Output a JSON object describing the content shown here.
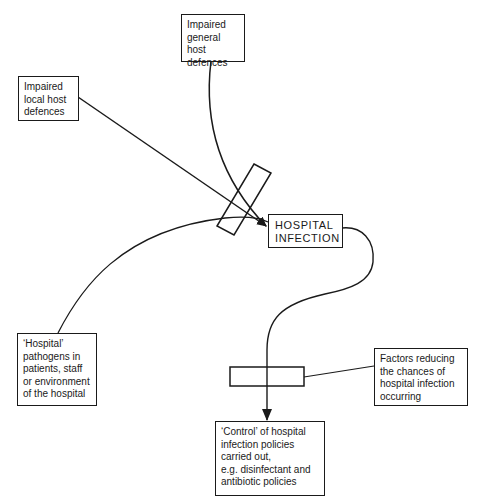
{
  "diagram": {
    "nodes": {
      "general_host": {
        "label": "Impaired\ngeneral host\ndefences"
      },
      "local_host": {
        "label": "Impaired\nlocal host\ndefences"
      },
      "hospital_infection": {
        "label": "HOSPITAL\nINFECTION"
      },
      "pathogens": {
        "label": "‘Hospital’\npathogens in\npatients, staff\nor environment\nof the hospital"
      },
      "factors": {
        "label": "Factors reducing\nthe chances of\nhospital infection\noccurring"
      },
      "control": {
        "label": "‘Control’ of hospital\ninfection policies\ncarried out,\ne.g. disinfectant and\nantibiotic policies"
      }
    },
    "edges": [
      {
        "from": "general_host",
        "to": "hospital_infection",
        "arrow": true
      },
      {
        "from": "local_host",
        "to": "hospital_infection",
        "arrow": true
      },
      {
        "from": "pathogens",
        "to": "hospital_infection",
        "arrow": false
      },
      {
        "from": "hospital_infection",
        "to": "control",
        "arrow": true
      },
      {
        "from": "factors",
        "to": "lower_barrier",
        "arrow": false
      }
    ],
    "barriers": [
      "upper_barrier",
      "lower_barrier"
    ],
    "colors": {
      "line": "#1a1a1a",
      "background": "#ffffff"
    }
  }
}
